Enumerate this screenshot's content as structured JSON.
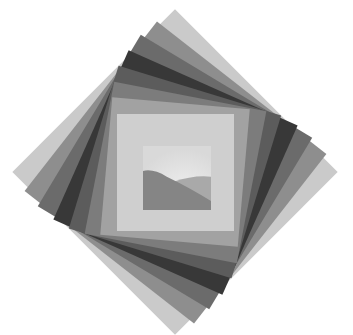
{
  "artwork": {
    "title": "",
    "center": {
      "x": 175,
      "y": 172
    },
    "background": "#ffffff",
    "layers": [
      {
        "side": 230,
        "rotation": 45,
        "color": "#cacaca"
      },
      {
        "side": 215,
        "rotation": 38,
        "color": "#8e8e8e"
      },
      {
        "side": 200,
        "rotation": 31,
        "color": "#6b6b6b"
      },
      {
        "side": 185,
        "rotation": 24,
        "color": "#383838"
      },
      {
        "side": 170,
        "rotation": 17,
        "color": "#5c5c5c"
      },
      {
        "side": 155,
        "rotation": 11,
        "color": "#7c7c7c"
      },
      {
        "side": 138,
        "rotation": 5,
        "color": "#a2a2a2"
      },
      {
        "side": 117,
        "rotation": 0,
        "color": "#cfcfcf"
      }
    ],
    "inset": {
      "x": 143,
      "y": 146,
      "width": 68,
      "height": 64,
      "sky_color": "#d9d9d9",
      "far_hill_color": "#a9a9a9",
      "near_hill_color": "#858585"
    }
  }
}
